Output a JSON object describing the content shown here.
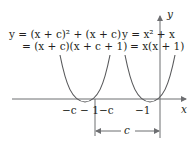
{
  "diagram": {
    "type": "graph-of-two-parabolas",
    "left_curve": {
      "line1": "y = (x + c)² + (x + c)",
      "line2": "= (x + c)(x + c + 1)",
      "roots": [
        "−c − 1",
        "−c"
      ]
    },
    "right_curve": {
      "line1": "y = x² + x",
      "line2": "= x(x + 1)",
      "roots": [
        "−1",
        "0"
      ]
    },
    "axes": {
      "x_label": "x",
      "y_label": "y"
    },
    "tick_labels": {
      "left_outer": "−c − 1",
      "left_inner": "−c",
      "right": "−1"
    },
    "shift_label": "c",
    "colors": {
      "curve": "#58595b",
      "axis": "#6d6e71",
      "text": "#231f20"
    }
  }
}
